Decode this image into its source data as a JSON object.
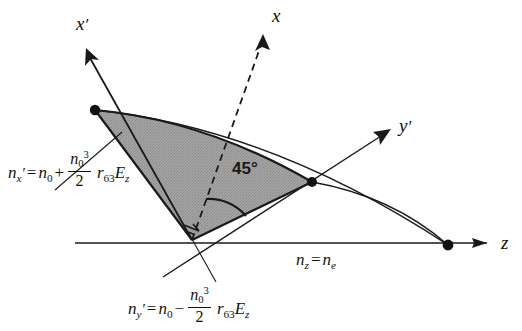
{
  "figure": {
    "background_color": "#ffffff",
    "line_color": "#1a1a1a",
    "shaded_region_color": "#9a9a9a"
  },
  "axes": [
    {
      "id": "x-prime",
      "label": "x",
      "prime": "′",
      "style": "solid",
      "name": "x-prime-axis"
    },
    {
      "id": "x",
      "label": "x",
      "prime": "",
      "style": "dashed",
      "name": "x-axis"
    },
    {
      "id": "y-prime",
      "label": "y",
      "prime": "′",
      "style": "solid",
      "name": "y-prime-axis"
    },
    {
      "id": "z",
      "label": "z",
      "prime": "",
      "style": "solid",
      "name": "z-axis"
    }
  ],
  "annotations": {
    "angle": "45°",
    "right_angle_marker": true
  },
  "equations": {
    "n_x_prime": {
      "lhs_symbol": "n",
      "lhs_sub": "x",
      "lhs_prime": "′",
      "equals": "=",
      "term1_symbol": "n",
      "term1_sub": "0",
      "operator": "+",
      "frac_num_symbol": "n",
      "frac_num_sub": "0",
      "frac_num_sup": "3",
      "frac_den": "2",
      "coeff_symbol": "r",
      "coeff_sub": "63",
      "field_symbol": "E",
      "field_sub": "z",
      "plain": "n_x' = n_0 + (n_0^3/2) r_63 E_z"
    },
    "n_y_prime": {
      "lhs_symbol": "n",
      "lhs_sub": "y",
      "lhs_prime": "′",
      "equals": "=",
      "term1_symbol": "n",
      "term1_sub": "0",
      "operator": "−",
      "frac_num_symbol": "n",
      "frac_num_sub": "0",
      "frac_num_sup": "3",
      "frac_den": "2",
      "coeff_symbol": "r",
      "coeff_sub": "63",
      "field_symbol": "E",
      "field_sub": "z",
      "plain": "n_y' = n_0 - (n_0^3/2) r_63 E_z"
    },
    "n_z": {
      "lhs_symbol": "n",
      "lhs_sub": "z",
      "equals": "=",
      "rhs_symbol": "n",
      "rhs_sub": "e",
      "plain": "n_z = n_e"
    }
  },
  "vertices": [
    {
      "name": "x-prime-vertex",
      "x": 95,
      "y": 110
    },
    {
      "name": "y-prime-vertex",
      "x": 312,
      "y": 182
    },
    {
      "name": "z-vertex",
      "x": 448,
      "y": 245
    }
  ]
}
